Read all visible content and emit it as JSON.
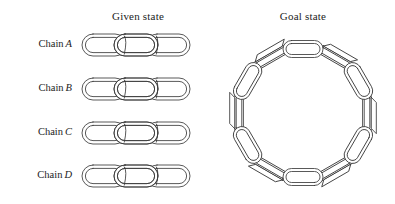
{
  "figure": {
    "type": "line-diagram",
    "background_color": "#ffffff",
    "stroke_color": "#3b3b3b",
    "width": 395,
    "height": 204
  },
  "panels": {
    "given": {
      "title": "Given state",
      "title_x": 138,
      "title_y": 16
    },
    "goal": {
      "title": "Goal state",
      "title_x": 303,
      "title_y": 16
    }
  },
  "given_state": {
    "label_prefix": "Chain",
    "links_per_chain": 3,
    "total_links": 12,
    "chains": [
      {
        "id": "A",
        "label_prefix": "Chain",
        "letter": "A",
        "label_y": 45,
        "row_y": 45,
        "links": 3,
        "closed": false
      },
      {
        "id": "B",
        "label_prefix": "Chain",
        "letter": "B",
        "label_y": 89,
        "row_y": 89,
        "links": 3,
        "closed": false
      },
      {
        "id": "C",
        "label_prefix": "Chain",
        "letter": "C",
        "label_y": 133,
        "row_y": 133,
        "links": 3,
        "closed": false
      },
      {
        "id": "D",
        "label_prefix": "Chain",
        "letter": "D",
        "label_y": 176,
        "row_y": 176,
        "links": 3,
        "closed": false
      }
    ],
    "row_start_x": 82,
    "link_width": 44,
    "link_height": 22,
    "link_pitch": 32
  },
  "goal_state": {
    "shape": "closed-ring",
    "links": 12,
    "center_x": 303,
    "center_y": 113,
    "ring_radius": 64,
    "link_length": 40,
    "link_width": 17,
    "orientation_pattern": "alternating flat / edge-on"
  }
}
